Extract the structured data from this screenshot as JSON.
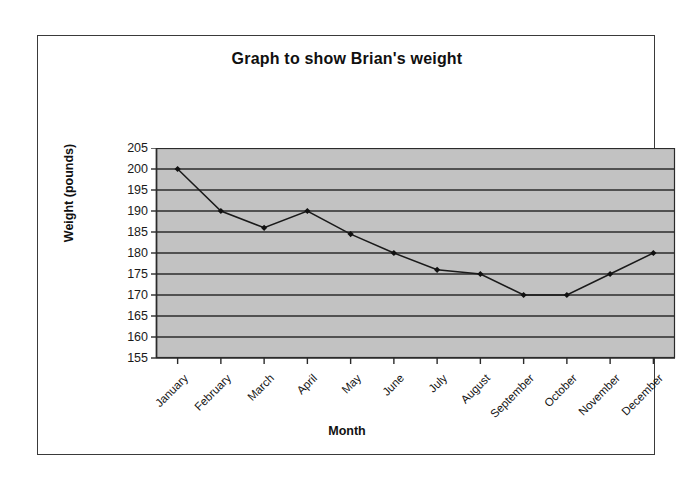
{
  "chart_data": {
    "type": "line",
    "title": "Graph to show Brian's weight",
    "xlabel": "Month",
    "ylabel": "Weight (pounds)",
    "categories": [
      "January",
      "February",
      "March",
      "April",
      "May",
      "June",
      "July",
      "August",
      "September",
      "October",
      "November",
      "December"
    ],
    "values": [
      200,
      190,
      186,
      190,
      184.5,
      180,
      176,
      175,
      170,
      170,
      175,
      180
    ],
    "ylim": [
      155,
      205
    ],
    "ytick_step": 5,
    "yticks": [
      205,
      200,
      195,
      190,
      185,
      180,
      175,
      170,
      165,
      160,
      155
    ],
    "grid": "horizontal",
    "legend": "none",
    "series": [
      {
        "name": "Weight",
        "values": [
          200,
          190,
          186,
          190,
          184.5,
          180,
          176,
          175,
          170,
          170,
          175,
          180
        ]
      }
    ],
    "colors": {
      "plot_background": "#c2c2c2",
      "gridline": "#2b2b2b",
      "line": "#1a1a1a",
      "marker": "#111111",
      "frame_border": "#3a3a3a",
      "page_background": "#ffffff"
    }
  }
}
